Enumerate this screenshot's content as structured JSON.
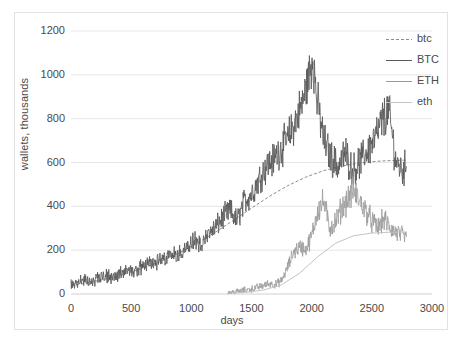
{
  "chart_data": {
    "type": "line",
    "title": "",
    "xlabel": "days",
    "ylabel": "wallets, thousands",
    "xlim": [
      0,
      3000
    ],
    "ylim": [
      0,
      1200
    ],
    "grid": true,
    "legend_position": "top-right",
    "xticks": [
      "0",
      "500",
      "1000",
      "1500",
      "2000",
      "2500",
      "3000"
    ],
    "yticks": [
      "0",
      "200",
      "400",
      "600",
      "800",
      "1000",
      "1200"
    ],
    "series": [
      {
        "name": "btc",
        "style": "dashed",
        "color": "#8c8c8c",
        "description": "smooth fitted trend for BTC wallets",
        "x": [
          0,
          150,
          300,
          450,
          600,
          750,
          900,
          1050,
          1200,
          1350,
          1500,
          1650,
          1800,
          1950,
          2100,
          2250,
          2400,
          2550,
          2700,
          2790
        ],
        "y": [
          38,
          52,
          70,
          92,
          118,
          150,
          188,
          232,
          282,
          336,
          392,
          446,
          494,
          533,
          563,
          584,
          598,
          606,
          610,
          611
        ]
      },
      {
        "name": "BTC",
        "style": "solid",
        "color": "#595959",
        "description": "daily BTC wallet counts, highly volatile, peak ~1080 near day 2000",
        "x": [
          0,
          60,
          120,
          180,
          240,
          300,
          360,
          420,
          480,
          540,
          600,
          660,
          720,
          780,
          840,
          900,
          960,
          1020,
          1080,
          1140,
          1200,
          1260,
          1320,
          1380,
          1440,
          1500,
          1560,
          1620,
          1680,
          1740,
          1800,
          1860,
          1920,
          1980,
          2010,
          2040,
          2100,
          2160,
          2220,
          2280,
          2340,
          2400,
          2460,
          2520,
          2580,
          2640,
          2700,
          2760,
          2790
        ],
        "y": [
          42,
          55,
          61,
          58,
          74,
          82,
          70,
          95,
          110,
          96,
          128,
          152,
          140,
          168,
          190,
          176,
          205,
          238,
          222,
          270,
          300,
          345,
          380,
          330,
          420,
          455,
          520,
          580,
          610,
          660,
          700,
          780,
          860,
          1000,
          1080,
          900,
          700,
          620,
          580,
          640,
          560,
          600,
          650,
          700,
          780,
          840,
          600,
          560,
          590
        ]
      },
      {
        "name": "ETH",
        "style": "solid",
        "color": "#9a9a9a",
        "description": "daily ETH wallet counts, begins ~day 1300, peak ~470 near day 2350",
        "x": [
          1300,
          1400,
          1500,
          1600,
          1650,
          1700,
          1750,
          1800,
          1850,
          1900,
          1950,
          2000,
          2050,
          2100,
          2150,
          2200,
          2250,
          2300,
          2350,
          2400,
          2450,
          2500,
          2550,
          2600,
          2650,
          2700,
          2750,
          2790
        ],
        "y": [
          5,
          12,
          22,
          38,
          48,
          42,
          60,
          120,
          190,
          215,
          200,
          260,
          380,
          420,
          300,
          330,
          390,
          430,
          470,
          420,
          380,
          330,
          300,
          340,
          300,
          280,
          265,
          250
        ]
      },
      {
        "name": "eth",
        "style": "solid",
        "color": "#c4c4c4",
        "description": "smooth fitted trend for ETH wallets",
        "x": [
          1300,
          1450,
          1600,
          1750,
          1900,
          2050,
          2200,
          2350,
          2500,
          2650,
          2790
        ],
        "y": [
          3,
          8,
          18,
          42,
          95,
          170,
          232,
          266,
          278,
          282,
          283
        ]
      }
    ]
  },
  "legend": {
    "items": [
      {
        "label": "btc"
      },
      {
        "label": "BTC"
      },
      {
        "label": "ETH"
      },
      {
        "label": "eth"
      }
    ]
  },
  "axes": {
    "x_title": "days",
    "y_title": "wallets, thousands"
  }
}
